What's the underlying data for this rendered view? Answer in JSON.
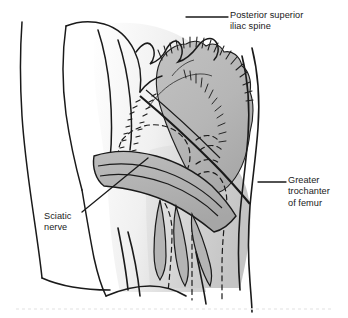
{
  "figure": {
    "name": "posterior-hip-dissection",
    "background_color": "#ffffff",
    "ink_color": "#1a1a1a",
    "muscle_fill": "#b8b8b8",
    "nerve_fill": "#b0b0b0",
    "skin_shade": "#dcdcdc",
    "width": 348,
    "height": 318
  },
  "labels": {
    "psis": "Posterior superior\niliac spine",
    "greater_trochanter": "Greater\ntrochanter\nof femur",
    "sciatic_nerve": "Sciatic\nnerve"
  },
  "leaders": {
    "psis": "horizontal leader from iliac crest to label",
    "greater_trochanter": "horizontal leader from femur head to label",
    "sciatic_nerve": "diagonal leader from nerve band to label"
  },
  "structures": [
    "torso-back-outline",
    "iliac-crest",
    "gluteus-maximus-flap",
    "cut-muscle-hatching",
    "sciatic-nerve-band",
    "nerve-branches",
    "femur-dashed-outline",
    "pelvis-dashed-outline",
    "thigh-outline"
  ]
}
